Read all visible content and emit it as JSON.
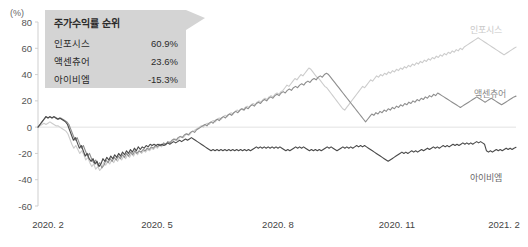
{
  "axes": {
    "unit": "(%)",
    "y_ticks": [
      "80",
      "60",
      "40",
      "20",
      "0",
      "-20",
      "-40",
      "-60"
    ],
    "x_ticks": [
      "2020. 2",
      "2020. 5",
      "2020. 8",
      "2020. 11",
      "2021. 2"
    ]
  },
  "legend": {
    "title": "주가수익률 순위",
    "rows": [
      {
        "name": "인포시스",
        "value": "60.9%"
      },
      {
        "name": "액센츄어",
        "value": "23.6%"
      },
      {
        "name": "아이비엠",
        "value": "-15.3%"
      }
    ]
  },
  "series_labels": {
    "infosys": "인포시스",
    "accenture": "액센츄어",
    "ibm": "아이비엠"
  },
  "colors": {
    "infosys": "#cccccc",
    "accenture": "#8e8e8e",
    "ibm": "#4a4a4a",
    "legend_bg": "#d4d4d4"
  },
  "chart_data": {
    "type": "line",
    "title": "",
    "xlabel": "",
    "ylabel": "(%)",
    "ylim": [
      -60,
      80
    ],
    "grid": false,
    "legend_position": "right-inline",
    "x_tick_labels": [
      "2020. 2",
      "2020. 5",
      "2020. 8",
      "2020. 11",
      "2021. 2"
    ],
    "x_tick_index": [
      0,
      62,
      125,
      187,
      249
    ],
    "n_points": 250,
    "series": [
      {
        "name": "인포시스",
        "final_value": 60.9,
        "color": "#cccccc",
        "values": [
          0,
          1,
          2,
          3,
          2,
          3,
          4,
          3,
          2,
          1,
          1,
          0,
          -1,
          -2,
          -3,
          -5,
          -9,
          -13,
          -16,
          -14,
          -17,
          -20,
          -18,
          -21,
          -25,
          -23,
          -27,
          -30,
          -28,
          -32,
          -30,
          -33,
          -31,
          -27,
          -29,
          -26,
          -28,
          -25,
          -27,
          -24,
          -26,
          -23,
          -25,
          -22,
          -24,
          -21,
          -23,
          -20,
          -22,
          -19,
          -21,
          -18,
          -20,
          -18,
          -19,
          -17,
          -18,
          -16,
          -17,
          -15,
          -16,
          -14,
          -15,
          -13,
          -14,
          -12,
          -11,
          -12,
          -10,
          -9,
          -10,
          -8,
          -7,
          -8,
          -6,
          -5,
          -6,
          -4,
          -3,
          -2,
          -1,
          0,
          1,
          0,
          2,
          3,
          2,
          4,
          5,
          4,
          6,
          7,
          6,
          8,
          9,
          8,
          10,
          11,
          10,
          12,
          13,
          12,
          14,
          13,
          15,
          16,
          15,
          17,
          18,
          17,
          19,
          20,
          19,
          21,
          22,
          21,
          23,
          24,
          23,
          25,
          26,
          25,
          27,
          28,
          30,
          32,
          31,
          33,
          35,
          37,
          36,
          38,
          40,
          39,
          41,
          43,
          45,
          44,
          42,
          40,
          38,
          37,
          35,
          33,
          31,
          30,
          28,
          26,
          24,
          22,
          20,
          18,
          16,
          14,
          13,
          15,
          17,
          19,
          21,
          23,
          25,
          27,
          29,
          31,
          30,
          32,
          34,
          36,
          35,
          37,
          39,
          38,
          40,
          39,
          41,
          40,
          42,
          41,
          43,
          42,
          44,
          43,
          45,
          44,
          46,
          45,
          47,
          46,
          48,
          47,
          49,
          48,
          50,
          49,
          51,
          50,
          52,
          51,
          53,
          52,
          54,
          53,
          55,
          54,
          56,
          55,
          57,
          56,
          58,
          57,
          59,
          58,
          60,
          59,
          61,
          62,
          63,
          64,
          65,
          66,
          67,
          68,
          67,
          66,
          65,
          64,
          63,
          62,
          61,
          60,
          59,
          58,
          57,
          56,
          55,
          56,
          57,
          58,
          59,
          60,
          60.9
        ]
      },
      {
        "name": "액센츄어",
        "final_value": 23.6,
        "color": "#8e8e8e",
        "values": [
          0,
          2,
          4,
          6,
          8,
          7,
          8,
          7,
          8,
          7,
          6,
          7,
          6,
          5,
          4,
          2,
          -2,
          -6,
          -10,
          -8,
          -12,
          -16,
          -14,
          -18,
          -22,
          -20,
          -24,
          -27,
          -25,
          -29,
          -27,
          -31,
          -29,
          -25,
          -27,
          -24,
          -26,
          -23,
          -25,
          -22,
          -24,
          -21,
          -23,
          -20,
          -22,
          -19,
          -21,
          -18,
          -20,
          -18,
          -19,
          -17,
          -18,
          -16,
          -17,
          -15,
          -16,
          -14,
          -15,
          -13,
          -14,
          -12,
          -13,
          -11,
          -12,
          -10,
          -9,
          -10,
          -8,
          -7,
          -8,
          -6,
          -5,
          -6,
          -4,
          -3,
          -4,
          -2,
          -1,
          0,
          1,
          2,
          1,
          3,
          4,
          3,
          5,
          6,
          5,
          7,
          8,
          7,
          9,
          10,
          9,
          11,
          12,
          11,
          13,
          14,
          13,
          15,
          14,
          16,
          17,
          16,
          18,
          19,
          18,
          20,
          21,
          20,
          22,
          23,
          22,
          24,
          25,
          24,
          26,
          27,
          26,
          28,
          29,
          28,
          30,
          31,
          30,
          32,
          33,
          32,
          34,
          35,
          34,
          36,
          37,
          36,
          38,
          39,
          38,
          40,
          41,
          40,
          38,
          36,
          34,
          32,
          30,
          28,
          26,
          24,
          22,
          20,
          18,
          16,
          14,
          12,
          10,
          8,
          6,
          4,
          6,
          8,
          10,
          9,
          11,
          10,
          12,
          11,
          13,
          12,
          14,
          13,
          15,
          14,
          16,
          15,
          17,
          16,
          18,
          17,
          19,
          18,
          20,
          19,
          21,
          20,
          22,
          21,
          23,
          22,
          24,
          23,
          25,
          24,
          26,
          25,
          24,
          23,
          22,
          21,
          20,
          19,
          18,
          17,
          16,
          15,
          16,
          17,
          18,
          19,
          20,
          21,
          22,
          23,
          22,
          21,
          20,
          19,
          20,
          21,
          22,
          21,
          20,
          19,
          18,
          17,
          18,
          19,
          20,
          21,
          22,
          23,
          23.6
        ]
      },
      {
        "name": "아이비엠",
        "final_value": -15.3,
        "color": "#4a4a4a",
        "values": [
          0,
          2,
          4,
          6,
          8,
          7,
          8,
          7,
          8,
          7,
          6,
          7,
          6,
          5,
          4,
          2,
          -2,
          -6,
          -10,
          -8,
          -12,
          -16,
          -14,
          -18,
          -22,
          -20,
          -24,
          -26,
          -24,
          -28,
          -26,
          -30,
          -28,
          -24,
          -26,
          -23,
          -25,
          -22,
          -24,
          -21,
          -23,
          -20,
          -22,
          -19,
          -21,
          -18,
          -20,
          -17,
          -19,
          -16,
          -18,
          -15,
          -17,
          -15,
          -16,
          -14,
          -15,
          -13,
          -14,
          -13,
          -14,
          -13,
          -14,
          -13,
          -14,
          -13,
          -12,
          -13,
          -12,
          -11,
          -12,
          -11,
          -10,
          -11,
          -10,
          -9,
          -10,
          -9,
          -8,
          -9,
          -10,
          -11,
          -12,
          -13,
          -14,
          -15,
          -16,
          -17,
          -18,
          -17,
          -18,
          -17,
          -18,
          -17,
          -18,
          -17,
          -18,
          -17,
          -18,
          -17,
          -18,
          -17,
          -18,
          -17,
          -18,
          -17,
          -18,
          -17,
          -18,
          -17,
          -16,
          -15,
          -16,
          -15,
          -16,
          -15,
          -16,
          -15,
          -16,
          -15,
          -16,
          -15,
          -16,
          -15,
          -16,
          -17,
          -18,
          -17,
          -18,
          -17,
          -16,
          -15,
          -16,
          -15,
          -16,
          -15,
          -16,
          -17,
          -18,
          -17,
          -18,
          -17,
          -18,
          -17,
          -18,
          -17,
          -16,
          -15,
          -16,
          -15,
          -16,
          -17,
          -18,
          -17,
          -16,
          -15,
          -16,
          -15,
          -16,
          -15,
          -16,
          -15,
          -14,
          -15,
          -14,
          -15,
          -14,
          -15,
          -16,
          -17,
          -18,
          -19,
          -20,
          -21,
          -22,
          -23,
          -24,
          -25,
          -26,
          -25,
          -24,
          -23,
          -22,
          -21,
          -20,
          -19,
          -20,
          -19,
          -20,
          -19,
          -18,
          -19,
          -18,
          -19,
          -18,
          -17,
          -18,
          -17,
          -16,
          -17,
          -16,
          -15,
          -16,
          -15,
          -16,
          -15,
          -14,
          -15,
          -14,
          -15,
          -14,
          -13,
          -14,
          -13,
          -14,
          -13,
          -12,
          -13,
          -12,
          -13,
          -12,
          -13,
          -12,
          -11,
          -12,
          -11,
          -12,
          -13,
          -18,
          -19,
          -18,
          -19,
          -18,
          -17,
          -18,
          -17,
          -18,
          -17,
          -16,
          -17,
          -16,
          -17,
          -16,
          -15.3
        ]
      }
    ]
  }
}
